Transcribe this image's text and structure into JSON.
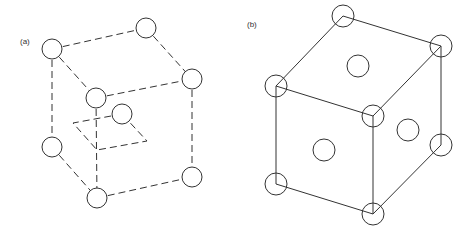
{
  "figure": {
    "panels": [
      {
        "label": "(a)",
        "description": "Body-centered cubic unit cell with dashed edges and a dashed plane through the center atom",
        "atoms": 9
      },
      {
        "label": "(b)",
        "description": "Face-centered cubic unit cell with solid edges, corner atoms and face-center atoms",
        "atoms": 11
      }
    ],
    "colors": {
      "line": "#333333",
      "background": "#ffffff"
    }
  }
}
